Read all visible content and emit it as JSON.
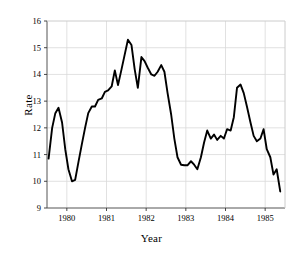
{
  "chart_data": {
    "type": "line",
    "title": "",
    "xlabel": "Year",
    "ylabel": "Rate",
    "xlim": [
      1979.5,
      1985.5
    ],
    "ylim": [
      9,
      16
    ],
    "grid": true,
    "legend": "none",
    "yticks": [
      9,
      10,
      11,
      12,
      13,
      14,
      15,
      16
    ],
    "ytick_labels": [
      "9",
      "10",
      "11",
      "12",
      "13",
      "14",
      "15",
      "16"
    ],
    "xticks": [
      1980,
      1981,
      1982,
      1983,
      1984,
      1985
    ],
    "xtick_labels": [
      "1980",
      "1981",
      "1982",
      "1983",
      "1984",
      "1985"
    ],
    "series": [
      {
        "name": "Rate",
        "color": "#000000",
        "x": [
          1979.54,
          1979.63,
          1979.71,
          1979.79,
          1979.88,
          1979.96,
          1980.04,
          1980.13,
          1980.21,
          1980.29,
          1980.38,
          1980.46,
          1980.54,
          1980.63,
          1980.71,
          1980.79,
          1980.88,
          1980.96,
          1981.04,
          1981.13,
          1981.21,
          1981.29,
          1981.38,
          1981.46,
          1981.54,
          1981.63,
          1981.71,
          1981.79,
          1981.88,
          1981.96,
          1982.04,
          1982.13,
          1982.21,
          1982.29,
          1982.38,
          1982.46,
          1982.54,
          1982.63,
          1982.71,
          1982.79,
          1982.88,
          1982.96,
          1983.04,
          1983.13,
          1983.21,
          1983.29,
          1983.38,
          1983.46,
          1983.54,
          1983.63,
          1983.71,
          1983.79,
          1983.88,
          1983.96,
          1984.04,
          1984.13,
          1984.21,
          1984.29,
          1984.38,
          1984.46,
          1984.54,
          1984.63,
          1984.71,
          1984.79,
          1984.88,
          1984.96,
          1985.04,
          1985.13,
          1985.21,
          1985.29,
          1985.38
        ],
        "y": [
          10.85,
          12.0,
          12.55,
          12.75,
          12.2,
          11.2,
          10.45,
          10.0,
          10.05,
          10.7,
          11.4,
          12.0,
          12.55,
          12.8,
          12.8,
          13.05,
          13.1,
          13.35,
          13.4,
          13.55,
          14.15,
          13.6,
          14.2,
          14.75,
          15.3,
          15.1,
          14.2,
          13.5,
          14.65,
          14.5,
          14.25,
          14.0,
          13.95,
          14.1,
          14.35,
          14.1,
          13.3,
          12.5,
          11.6,
          10.9,
          10.62,
          10.6,
          10.6,
          10.75,
          10.62,
          10.45,
          10.9,
          11.45,
          11.9,
          11.6,
          11.75,
          11.55,
          11.7,
          11.6,
          11.95,
          11.9,
          12.4,
          13.5,
          13.62,
          13.3,
          12.8,
          12.2,
          11.7,
          11.5,
          11.6,
          11.95,
          11.2,
          10.9,
          10.25,
          10.45,
          9.62
        ]
      }
    ]
  }
}
